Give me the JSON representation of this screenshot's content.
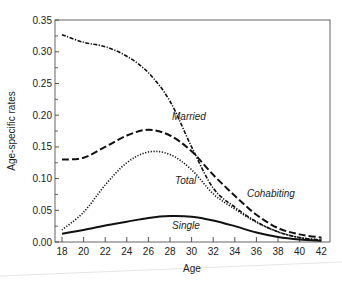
{
  "chart_data": {
    "type": "line",
    "title": "",
    "xlabel": "Age",
    "ylabel": "Age-specific rates",
    "xlim": [
      18,
      42
    ],
    "ylim": [
      0,
      0.35
    ],
    "x_ticks": [
      18,
      20,
      22,
      24,
      26,
      28,
      30,
      32,
      34,
      36,
      38,
      40,
      42
    ],
    "y_ticks": [
      0.0,
      0.05,
      0.1,
      0.15,
      0.2,
      0.25,
      0.3,
      0.35
    ],
    "y_tick_labels": [
      "0.00",
      "0.05",
      "0.10",
      "0.15",
      "0.20",
      "0.25",
      "0.30",
      "0.35"
    ],
    "grid": false,
    "legend": "inline labels",
    "x": [
      18,
      20,
      22,
      24,
      26,
      28,
      30,
      32,
      34,
      36,
      38,
      40,
      42
    ],
    "series": [
      {
        "name": "Married",
        "style": "dash-dot",
        "values": [
          0.327,
          0.315,
          0.308,
          0.293,
          0.267,
          0.222,
          0.15,
          0.085,
          0.055,
          0.032,
          0.016,
          0.007,
          0.003
        ],
        "label_pos": {
          "x": 172,
          "y": 120
        }
      },
      {
        "name": "Cohabiting",
        "style": "dashed",
        "values": [
          0.13,
          0.133,
          0.15,
          0.168,
          0.177,
          0.168,
          0.143,
          0.106,
          0.073,
          0.043,
          0.022,
          0.012,
          0.007
        ],
        "label_pos": {
          "x": 247,
          "y": 197
        }
      },
      {
        "name": "Total",
        "style": "dotted",
        "values": [
          0.019,
          0.047,
          0.09,
          0.125,
          0.142,
          0.138,
          0.114,
          0.076,
          0.052,
          0.031,
          0.016,
          0.007,
          0.003
        ],
        "label_pos": {
          "x": 175,
          "y": 184
        }
      },
      {
        "name": "Single",
        "style": "solid",
        "values": [
          0.013,
          0.019,
          0.026,
          0.032,
          0.038,
          0.041,
          0.04,
          0.034,
          0.025,
          0.015,
          0.008,
          0.004,
          0.002
        ],
        "label_pos": {
          "x": 172,
          "y": 229
        }
      }
    ]
  },
  "plot": {
    "left": 55,
    "right": 330,
    "top": 20,
    "bottom": 242,
    "x_at_18": 62,
    "px_per_year": 10.8,
    "px_per_unit": 634
  }
}
